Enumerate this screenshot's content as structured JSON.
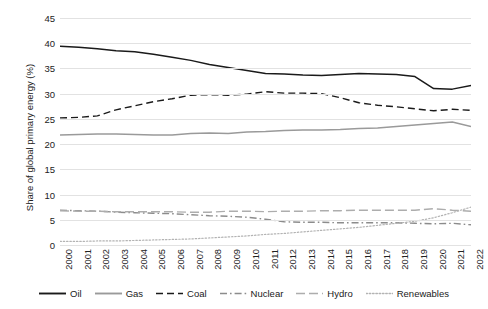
{
  "chart_data": {
    "type": "line",
    "title": "",
    "xlabel": "",
    "ylabel": "Share of global primary energy (%)",
    "ylim": [
      0,
      45
    ],
    "yticks": [
      0,
      5,
      10,
      15,
      20,
      25,
      30,
      35,
      40,
      45
    ],
    "grid": true,
    "legend_position": "bottom",
    "categories": [
      "2000",
      "2001",
      "2002",
      "2003",
      "2004",
      "2005",
      "2006",
      "2007",
      "2008",
      "2009",
      "2010",
      "2011",
      "2012",
      "2013",
      "2014",
      "2015",
      "2016",
      "2017",
      "2018",
      "2019",
      "2020",
      "2021",
      "2022"
    ],
    "series": [
      {
        "name": "Oil",
        "style": "solid",
        "color": "#1a1a1a",
        "values": [
          39.4,
          39.2,
          38.9,
          38.5,
          38.3,
          37.8,
          37.2,
          36.6,
          35.8,
          35.2,
          34.6,
          34.0,
          33.9,
          33.7,
          33.6,
          33.8,
          34.0,
          33.9,
          33.8,
          33.4,
          31.0,
          30.9,
          31.6
        ]
      },
      {
        "name": "Gas",
        "style": "solid",
        "color": "#9a9a9a",
        "values": [
          21.8,
          21.9,
          22.0,
          22.0,
          21.9,
          21.8,
          21.8,
          22.1,
          22.2,
          22.1,
          22.4,
          22.5,
          22.7,
          22.8,
          22.8,
          22.9,
          23.1,
          23.2,
          23.5,
          23.8,
          24.1,
          24.4,
          23.5
        ]
      },
      {
        "name": "Coal",
        "style": "dashed",
        "color": "#1a1a1a",
        "values": [
          25.2,
          25.3,
          25.6,
          26.8,
          27.6,
          28.4,
          29.0,
          29.7,
          29.8,
          29.7,
          29.9,
          30.4,
          30.1,
          30.1,
          30.0,
          29.2,
          28.2,
          27.7,
          27.4,
          27.0,
          26.6,
          26.9,
          26.7
        ]
      },
      {
        "name": "Nuclear",
        "style": "dashdot",
        "color": "#8c8c8c",
        "values": [
          6.9,
          6.8,
          6.7,
          6.5,
          6.4,
          6.3,
          6.2,
          6.0,
          5.8,
          5.7,
          5.5,
          5.1,
          4.6,
          4.5,
          4.5,
          4.4,
          4.4,
          4.4,
          4.4,
          4.3,
          4.2,
          4.3,
          4.0
        ]
      },
      {
        "name": "Hydro",
        "style": "longdash",
        "color": "#adadad",
        "values": [
          6.8,
          6.7,
          6.7,
          6.6,
          6.6,
          6.6,
          6.6,
          6.5,
          6.5,
          6.7,
          6.7,
          6.6,
          6.7,
          6.7,
          6.8,
          6.8,
          6.9,
          6.9,
          6.9,
          6.9,
          7.2,
          6.9,
          6.7
        ]
      },
      {
        "name": "Renewables",
        "style": "dotted",
        "color": "#b3b3b3",
        "values": [
          0.7,
          0.7,
          0.8,
          0.8,
          0.9,
          1.0,
          1.1,
          1.2,
          1.4,
          1.6,
          1.8,
          2.1,
          2.3,
          2.6,
          2.9,
          3.2,
          3.5,
          3.9,
          4.3,
          4.7,
          5.4,
          6.4,
          7.5
        ]
      }
    ]
  },
  "caption": ""
}
